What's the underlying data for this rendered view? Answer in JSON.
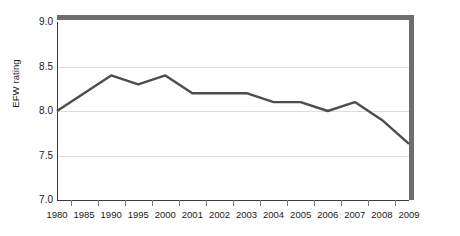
{
  "chart_data": {
    "type": "line",
    "title": "",
    "xlabel": "",
    "ylabel": "EFW rating",
    "categories": [
      "1980",
      "1985",
      "1990",
      "1995",
      "2000",
      "2001",
      "2002",
      "2003",
      "2004",
      "2005",
      "2006",
      "2007",
      "2008",
      "2009"
    ],
    "values": [
      8.0,
      8.2,
      8.4,
      8.3,
      8.4,
      8.2,
      8.2,
      8.2,
      8.1,
      8.1,
      8.0,
      8.1,
      7.9,
      7.63
    ],
    "series": [
      {
        "name": "EFW rating",
        "values": [
          8.0,
          8.2,
          8.4,
          8.3,
          8.4,
          8.2,
          8.2,
          8.2,
          8.1,
          8.1,
          8.0,
          8.1,
          7.9,
          7.63
        ]
      }
    ],
    "ylim": [
      7.0,
      9.0
    ],
    "yticks": [
      "7.0",
      "7.5",
      "8.0",
      "8.5",
      "9.0"
    ],
    "ytick_values": [
      7.0,
      7.5,
      8.0,
      8.5,
      9.0
    ],
    "grid": true,
    "legend": false,
    "legend_position": "none",
    "line_color": "#4d4d4d",
    "grid_color": "#dcdcdc",
    "frame_color": "#6e6e6e",
    "axis_color": "#3a3a3a",
    "background_color": "#ffffff"
  }
}
